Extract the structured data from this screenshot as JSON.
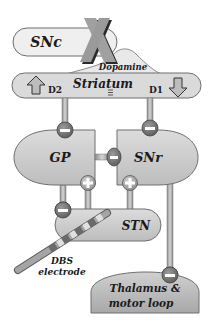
{
  "diagram": {
    "nodes": {
      "snc": {
        "label": "SNc",
        "lesioned": true
      },
      "striatum": {
        "label": "Striatum",
        "left_receptor": "D2",
        "right_receptor": "D1",
        "left_arrow": "up",
        "right_arrow": "down"
      },
      "gp": {
        "label": "GP"
      },
      "snr": {
        "label": "SNr"
      },
      "stn": {
        "label": "STN"
      },
      "thalamus": {
        "label_line1": "Thalamus &",
        "label_line2": "motor loop"
      }
    },
    "pathway_label": "Dopamine",
    "electrode": {
      "label_line1": "DBS",
      "label_line2": "electrode"
    },
    "connections": [
      {
        "from": "SNc",
        "to": "Striatum",
        "type": "dopamine"
      },
      {
        "from": "Striatum",
        "to": "GP",
        "sign": "-"
      },
      {
        "from": "Striatum",
        "to": "SNr",
        "sign": "-"
      },
      {
        "from": "GP",
        "to": "SNr",
        "sign": "-"
      },
      {
        "from": "STN",
        "to": "GP",
        "sign": "+"
      },
      {
        "from": "STN",
        "to": "SNr",
        "sign": "+"
      },
      {
        "from": "GP",
        "to": "STN",
        "sign": "-"
      },
      {
        "from": "SNr",
        "to": "Thalamus & motor loop",
        "sign": "-"
      }
    ],
    "colors": {
      "snc_fill": "#efefef",
      "nucleus_fill": "#cfcfcf",
      "striatum_fill": "#dadada",
      "outline": "#6e6e6e",
      "synapse_fill": "#7a7a7a",
      "x_mark": "#9a9a9a"
    }
  }
}
